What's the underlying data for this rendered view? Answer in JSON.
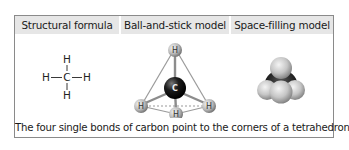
{
  "table": {
    "headers": [
      "Structural formula",
      "Ball-and-stick model",
      "Space-filling model"
    ],
    "caption": "The four single bonds of carbon point to the corners of a tetrahedron."
  },
  "structural_formula": {
    "atoms": {
      "top": "H",
      "left": "H",
      "center": "C",
      "right": "H",
      "bottom": "H"
    }
  },
  "ball_and_stick": {
    "center_atom": "C",
    "outer_atoms": [
      "H",
      "H",
      "H",
      "H"
    ]
  },
  "colors": {
    "header_bg": "#e6e6e6",
    "border": "#8a8a8a",
    "carbon": "#1a1a1a",
    "hydrogen": "#c8c8c8"
  }
}
